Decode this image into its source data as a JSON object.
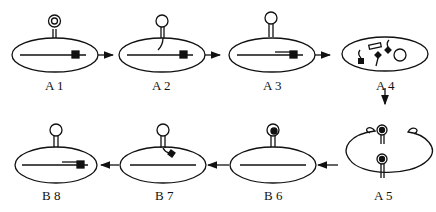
{
  "diagram": {
    "stages": [
      {
        "id": "A1",
        "label": "A 1"
      },
      {
        "id": "A2",
        "label": "A 2"
      },
      {
        "id": "A3",
        "label": "A 3"
      },
      {
        "id": "A4",
        "label": "A 4"
      },
      {
        "id": "A5",
        "label": "A 5"
      },
      {
        "id": "B6",
        "label": "B 6"
      },
      {
        "id": "B7",
        "label": "B 7"
      },
      {
        "id": "B8",
        "label": "B 8"
      }
    ],
    "flow": [
      "A1",
      "A2",
      "A3",
      "A4",
      "A5",
      "B6",
      "B7",
      "B8"
    ],
    "colors": {
      "stroke": "#111111",
      "background": "#ffffff"
    }
  }
}
